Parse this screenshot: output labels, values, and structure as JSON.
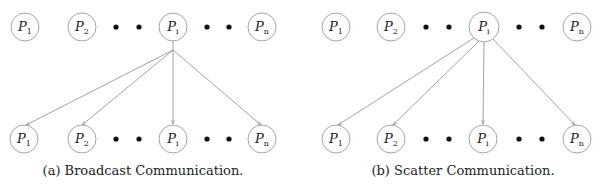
{
  "colors": {
    "node_stroke": "#9a9a9a",
    "edge": "#8c8c8c",
    "dot": "#111111",
    "text": "#222222"
  },
  "diagrams": [
    {
      "id": "broadcast",
      "caption": "(a) Broadcast Communication.",
      "top_row": [
        {
          "label": "P",
          "sub": "1",
          "x": 25
        },
        {
          "label": "P",
          "sub": "2",
          "x": 82
        },
        {
          "label": "P",
          "sub": "i",
          "x": 173
        },
        {
          "label": "P",
          "sub": "n",
          "x": 262
        }
      ],
      "bottom_row": [
        {
          "label": "P",
          "sub": "1",
          "x": 24
        },
        {
          "label": "P",
          "sub": "2",
          "x": 82
        },
        {
          "label": "P",
          "sub": "i",
          "x": 173
        },
        {
          "label": "P",
          "sub": "n",
          "x": 262
        }
      ],
      "ellipsis_dots_x": [
        116,
        139,
        207,
        229
      ],
      "source": "P_i",
      "edge_style": "single stem then fan-out to all receivers"
    },
    {
      "id": "scatter",
      "caption": "(b) Scatter Communication.",
      "top_row": [
        {
          "label": "P",
          "sub": "1",
          "x": 336
        },
        {
          "label": "P",
          "sub": "2",
          "x": 391
        },
        {
          "label": "P",
          "sub": "i",
          "x": 484
        },
        {
          "label": "P",
          "sub": "n",
          "x": 577
        }
      ],
      "bottom_row": [
        {
          "label": "P",
          "sub": "1",
          "x": 336
        },
        {
          "label": "P",
          "sub": "2",
          "x": 391
        },
        {
          "label": "P",
          "sub": "i",
          "x": 483
        },
        {
          "label": "P",
          "sub": "n",
          "x": 577
        }
      ],
      "ellipsis_dots_x": [
        426,
        449,
        519,
        542
      ],
      "source": "P_i",
      "edge_style": "separate edges from source perimeter to each receiver"
    }
  ]
}
